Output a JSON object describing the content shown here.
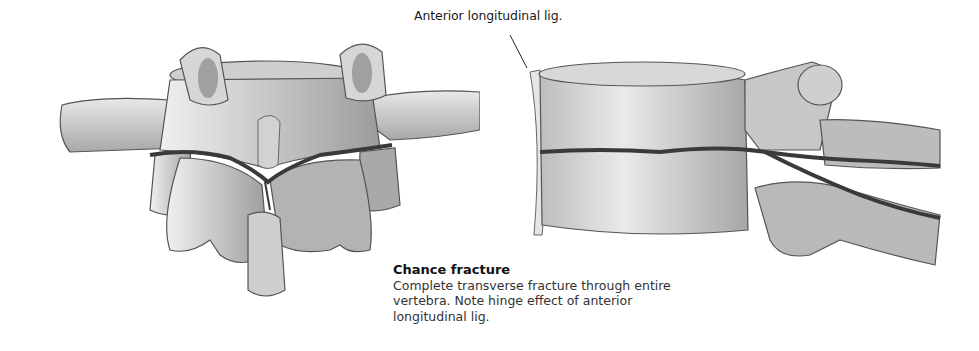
{
  "figure": {
    "labels": {
      "anterior_ligament": "Anterior longitudinal lig."
    },
    "caption": {
      "title": "Chance fracture",
      "body": "Complete transverse fracture through entire vertebra. Note hinge effect of anterior longitudinal lig."
    },
    "views": [
      {
        "id": "posterior-view",
        "description": "Posterior view of vertebra with transverse fracture line through laminae and spinous process"
      },
      {
        "id": "lateral-view",
        "description": "Lateral view of vertebra showing fracture through body and posterior elements with intact anterior longitudinal ligament"
      }
    ],
    "colors": {
      "bone": "#d9d9d9",
      "bone_shadow": "#9a9a9a",
      "fracture": "#3a3a3a",
      "outline": "#555555"
    }
  }
}
